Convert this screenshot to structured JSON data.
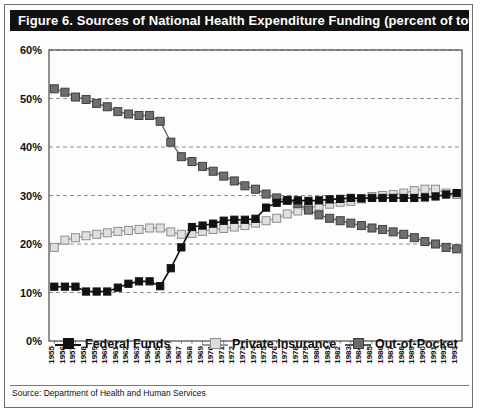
{
  "figure": {
    "title": "Figure 6.  Sources of National Health Expenditure Funding (percent of total)",
    "source": "Source: Department of Health and Human Services"
  },
  "legend": {
    "position": "bottom",
    "items": [
      {
        "label": "Federal Funds",
        "color": "#111111",
        "marker": "filled-square"
      },
      {
        "label": "Private Insurance",
        "color": "#d4d4d4",
        "marker": "open-square"
      },
      {
        "label": "Out-of-Pocket",
        "color": "#6b6b6b",
        "marker": "shaded-square"
      }
    ]
  },
  "axes": {
    "y_ticks": [
      "0%",
      "10%",
      "20%",
      "30%",
      "40%",
      "50%",
      "60%"
    ],
    "y_min": 0,
    "y_max": 60,
    "grid": true
  },
  "chart_data": {
    "type": "line",
    "title": "Figure 6.  Sources of National Health Expenditure Funding (percent of total)",
    "xlabel": "",
    "ylabel": "",
    "ylim": [
      0,
      60
    ],
    "ytick_values": [
      0,
      10,
      20,
      30,
      40,
      50,
      60
    ],
    "grid": true,
    "legend_position": "bottom",
    "categories": [
      "1955",
      "1956",
      "1957",
      "1958",
      "1959",
      "1960",
      "1961",
      "1962",
      "1963",
      "1964",
      "1965",
      "1966",
      "1967",
      "1968",
      "1969",
      "1970",
      "1971",
      "1972",
      "1973",
      "1974",
      "1975",
      "1976",
      "1977",
      "1978",
      "1979",
      "1980",
      "1981",
      "1982",
      "1983",
      "1984",
      "1985",
      "1986",
      "1987",
      "1988",
      "1989",
      "1990",
      "1991",
      "1992",
      "1993"
    ],
    "series": [
      {
        "name": "Federal Funds",
        "color": "#111111",
        "values": [
          11.2,
          11.2,
          11.2,
          10.2,
          10.2,
          10.2,
          11.0,
          11.8,
          12.3,
          12.3,
          11.3,
          15.0,
          19.3,
          23.5,
          23.8,
          24.2,
          24.8,
          25.0,
          25.0,
          25.2,
          27.5,
          28.5,
          29.0,
          29.0,
          28.9,
          29.0,
          29.2,
          29.3,
          29.5,
          29.4,
          29.5,
          29.5,
          29.5,
          29.5,
          29.5,
          29.6,
          29.8,
          30.2,
          30.5
        ]
      },
      {
        "name": "Private Insurance",
        "color": "#d4d4d4",
        "values": [
          19.3,
          20.8,
          21.3,
          21.7,
          22.0,
          22.3,
          22.6,
          22.8,
          23.0,
          23.3,
          23.3,
          22.5,
          22.0,
          22.2,
          22.6,
          23.0,
          23.2,
          23.5,
          23.8,
          24.3,
          24.8,
          25.3,
          26.2,
          26.8,
          27.5,
          27.8,
          28.2,
          28.6,
          28.8,
          29.3,
          29.8,
          30.0,
          30.2,
          30.5,
          31.0,
          31.3,
          31.3,
          30.5,
          30.2
        ]
      },
      {
        "name": "Out-of-Pocket",
        "color": "#6b6b6b",
        "values": [
          52.0,
          51.3,
          50.3,
          49.8,
          49.0,
          48.3,
          47.3,
          46.8,
          46.5,
          46.5,
          45.3,
          41.0,
          38.0,
          37.0,
          36.0,
          35.0,
          34.0,
          33.0,
          32.0,
          31.3,
          30.3,
          29.5,
          29.0,
          28.3,
          27.0,
          26.0,
          25.3,
          24.8,
          24.3,
          23.8,
          23.3,
          23.0,
          22.5,
          22.0,
          21.3,
          20.5,
          20.0,
          19.3,
          19.0
        ]
      }
    ]
  }
}
